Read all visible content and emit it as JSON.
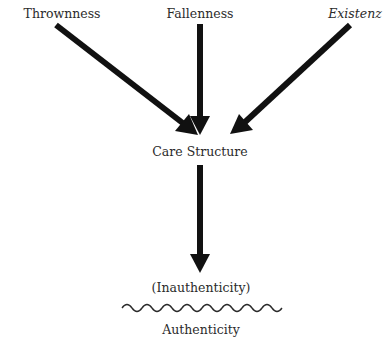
{
  "diagram": {
    "nodes": {
      "thrownness": {
        "label": "Thrownness"
      },
      "fallenness": {
        "label": "Fallenness"
      },
      "existenz": {
        "label": "Existenz",
        "italic": true
      },
      "care_structure": {
        "label": "Care Structure"
      },
      "inauthenticity": {
        "label": "(Inauthenticity)"
      },
      "authenticity": {
        "label": "Authenticity"
      }
    },
    "edges": [
      {
        "from": "thrownness",
        "to": "care_structure"
      },
      {
        "from": "fallenness",
        "to": "care_structure"
      },
      {
        "from": "existenz",
        "to": "care_structure"
      },
      {
        "from": "care_structure",
        "to": "inauthenticity"
      }
    ],
    "separator": {
      "type": "wavy-line",
      "between": [
        "inauthenticity",
        "authenticity"
      ]
    },
    "colors": {
      "arrow": "#111111",
      "text": "#2b2b2b",
      "background": "#ffffff"
    }
  }
}
